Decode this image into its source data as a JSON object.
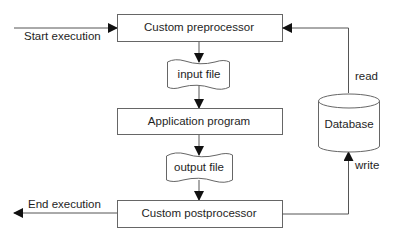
{
  "diagram": {
    "type": "flowchart",
    "nodes": {
      "preprocessor": {
        "label": "Custom preprocessor",
        "shape": "rectangle"
      },
      "input_file": {
        "label": "input file",
        "shape": "document"
      },
      "application": {
        "label": "Application program",
        "shape": "rectangle"
      },
      "output_file": {
        "label": "output file",
        "shape": "document"
      },
      "postprocessor": {
        "label": "Custom postprocessor",
        "shape": "rectangle"
      },
      "database": {
        "label": "Database",
        "shape": "cylinder"
      }
    },
    "edges": {
      "start": {
        "label": "Start execution",
        "to": "preprocessor"
      },
      "end": {
        "label": "End execution",
        "from": "postprocessor"
      },
      "read": {
        "label": "read",
        "from": "database",
        "to": "preprocessor"
      },
      "write": {
        "label": "write",
        "from": "postprocessor",
        "to": "database"
      },
      "pre_to_input": {
        "from": "preprocessor",
        "to": "input_file"
      },
      "input_to_app": {
        "from": "input_file",
        "to": "application"
      },
      "app_to_output": {
        "from": "application",
        "to": "output_file"
      },
      "output_to_post": {
        "from": "output_file",
        "to": "postprocessor"
      }
    },
    "colors": {
      "stroke": "#555555",
      "arrow": "#111111",
      "text": "#1e1e1e"
    }
  }
}
